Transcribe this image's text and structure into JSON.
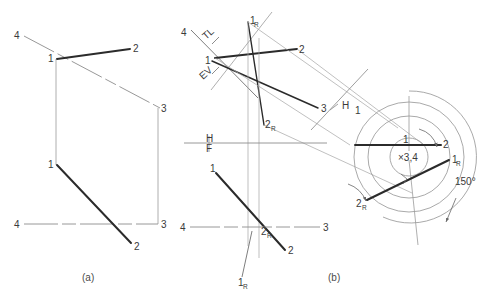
{
  "figure": {
    "background_color": "#ffffff",
    "ink_color": "#3a3a3a",
    "heavy_line_color": "#2b2b2b",
    "light_line_color": "#9a9a9a",
    "captions": [
      {
        "key": "a",
        "text": "(a)"
      },
      {
        "key": "b",
        "text": "(b)"
      }
    ]
  },
  "panel_a": {
    "caption": "(a)",
    "labels": {
      "top_left_4": "4",
      "top_right_2": "2",
      "top_inner_1": "1",
      "right_3": "3",
      "mid_left_1": "1",
      "bottom_left_4": "4",
      "bottom_right_3": "3",
      "bottom_2": "2"
    }
  },
  "panel_b": {
    "caption": "(b)",
    "labels": {
      "top_4": "4",
      "tl": "TL",
      "ev": "EV",
      "top_1R_main": "1",
      "top_1R_sub": "R",
      "top_1": "1",
      "top_2": "2",
      "mid_3": "3",
      "mid_2R_main": "2",
      "mid_2R_sub": "R",
      "fold_H_1_H": "H",
      "fold_H_1_1": "1",
      "fold_HF_H": "H",
      "fold_HF_F": "F",
      "lower_1": "1",
      "lower_4": "4",
      "lower_3": "3",
      "lower_2": "2",
      "lower_2R_main": "2",
      "lower_2R_sub": "R",
      "lower_1R_main": "1",
      "lower_1R_sub": "R"
    },
    "rotation": {
      "center_label": "×3,4",
      "angle_label": "150°",
      "point_1": "1",
      "point_2": "2",
      "point_1R_main": "1",
      "point_1R_sub": "R",
      "point_2R_main": "2",
      "point_2R_sub": "R"
    }
  }
}
